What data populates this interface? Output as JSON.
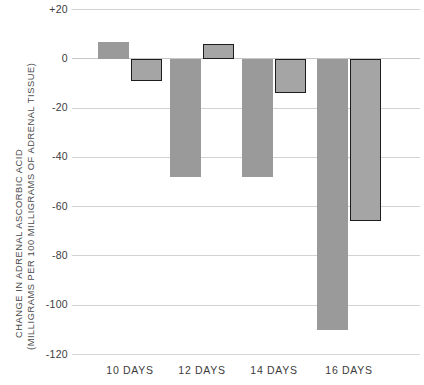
{
  "chart_data": {
    "type": "bar",
    "title": "",
    "subtitle": "",
    "xlabel": "",
    "ylabel": "CHANGE IN ADRENAL ASCORBIC ACID (MILLIGRAMS PER 100 MILLIGRAMS OF ADRENAL TISSUE)",
    "ylabel_line1": "CHANGE IN ADRENAL ASCORBIC ACID",
    "ylabel_line2": "(MILLIGRAMS PER 100 MILLIGRAMS OF ADRENAL TISSUE)",
    "categories": [
      "10 DAYS",
      "12 DAYS",
      "14 DAYS",
      "16 DAYS"
    ],
    "series": [
      {
        "name": "solid-gray-series",
        "style": "solid-fill",
        "color": "#9a9a9a",
        "values": [
          7,
          -48,
          -48,
          -110
        ]
      },
      {
        "name": "outlined-series",
        "style": "black-outline",
        "color": "#a5a5a5",
        "border_color": "#1d1d1d",
        "values": [
          -9,
          6,
          -14,
          -66
        ]
      }
    ],
    "ylim": [
      -120,
      20
    ],
    "ytick_labels": [
      "+20",
      "0",
      "-20",
      "-40",
      "-60",
      "-80",
      "-100",
      "-120"
    ],
    "ytick_values": [
      20,
      0,
      -20,
      -40,
      -60,
      -80,
      -100,
      -120
    ],
    "grid": true,
    "grid_axis": "y",
    "legend": false,
    "legend_position": "none"
  }
}
